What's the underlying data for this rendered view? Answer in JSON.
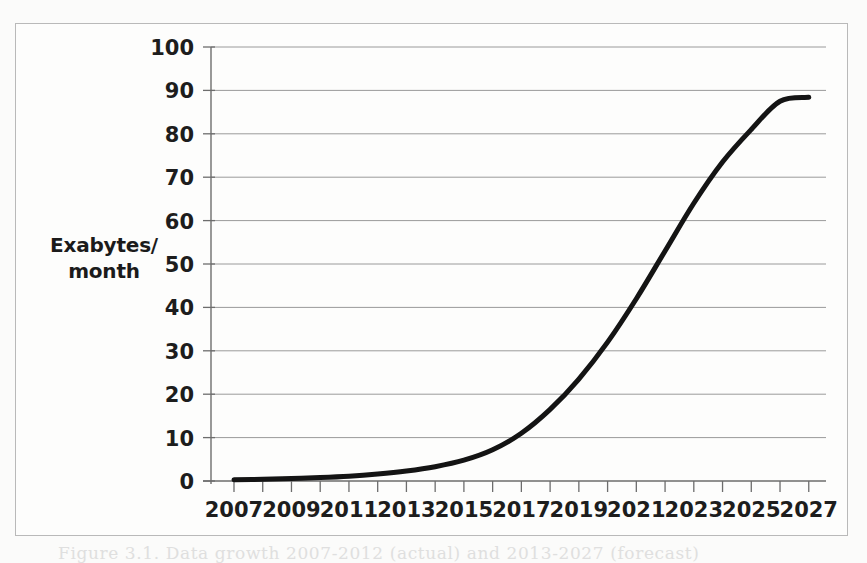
{
  "figure": {
    "background_color": "#fbfbfa",
    "frame_color": "#b9b9b9",
    "caption_partial": "Figure 3.1.   Data growth 2007-2012 (actual) and 2013-2027 (forecast)"
  },
  "axis": {
    "y_label_line1": "Exabytes/",
    "y_label_line2": "month",
    "y_ticks": [
      "100",
      "90",
      "80",
      "70",
      "60",
      "50",
      "40",
      "30",
      "20",
      "10",
      "0"
    ],
    "x_ticks": [
      "2007",
      "2009",
      "2011",
      "2013",
      "2015",
      "2017",
      "2019",
      "2021",
      "2023",
      "2025",
      "2027"
    ]
  },
  "chart_data": {
    "type": "line",
    "title": "",
    "xlabel": "",
    "ylabel": "Exabytes/ month",
    "xlim": [
      2006.2,
      2027.6
    ],
    "ylim": [
      0,
      100
    ],
    "grid": true,
    "legend": "none",
    "line_color": "#141414",
    "line_width": 5,
    "x": [
      2007,
      2008,
      2009,
      2010,
      2011,
      2012,
      2013,
      2014,
      2015,
      2016,
      2017,
      2018,
      2019,
      2020,
      2021,
      2022,
      2023,
      2024,
      2025,
      2026,
      2027
    ],
    "values": [
      0.3,
      0.4,
      0.6,
      0.8,
      1.1,
      1.6,
      2.3,
      3.3,
      4.8,
      7.2,
      11.0,
      16.5,
      23.5,
      32.0,
      42.0,
      53.0,
      64.0,
      73.5,
      81.0,
      87.5,
      88.4
    ],
    "series": [
      {
        "name": "Global data traffic",
        "values": [
          0.3,
          0.4,
          0.6,
          0.8,
          1.1,
          1.6,
          2.3,
          3.3,
          4.8,
          7.2,
          11.0,
          16.5,
          23.5,
          32.0,
          42.0,
          53.0,
          64.0,
          73.5,
          81.0,
          87.5,
          88.4
        ]
      }
    ],
    "x_minor_ticks": [
      2007,
      2008,
      2009,
      2010,
      2011,
      2012,
      2013,
      2014,
      2015,
      2016,
      2017,
      2018,
      2019,
      2020,
      2021,
      2022,
      2023,
      2024,
      2025,
      2026,
      2027
    ],
    "y_gridlines": [
      0,
      10,
      20,
      30,
      40,
      50,
      60,
      70,
      80,
      90,
      100
    ]
  }
}
